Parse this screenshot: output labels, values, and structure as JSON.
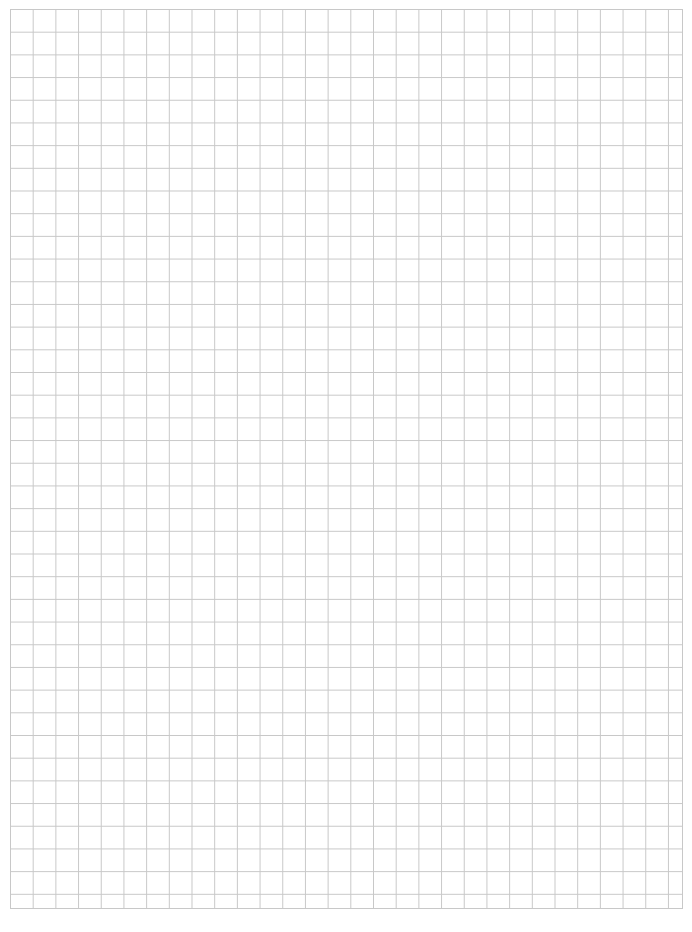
{
  "page": {
    "type": "grid-paper",
    "grid_color": "#c8c8c8",
    "background_color": "#ffffff",
    "columns": 30,
    "rows": 40
  }
}
